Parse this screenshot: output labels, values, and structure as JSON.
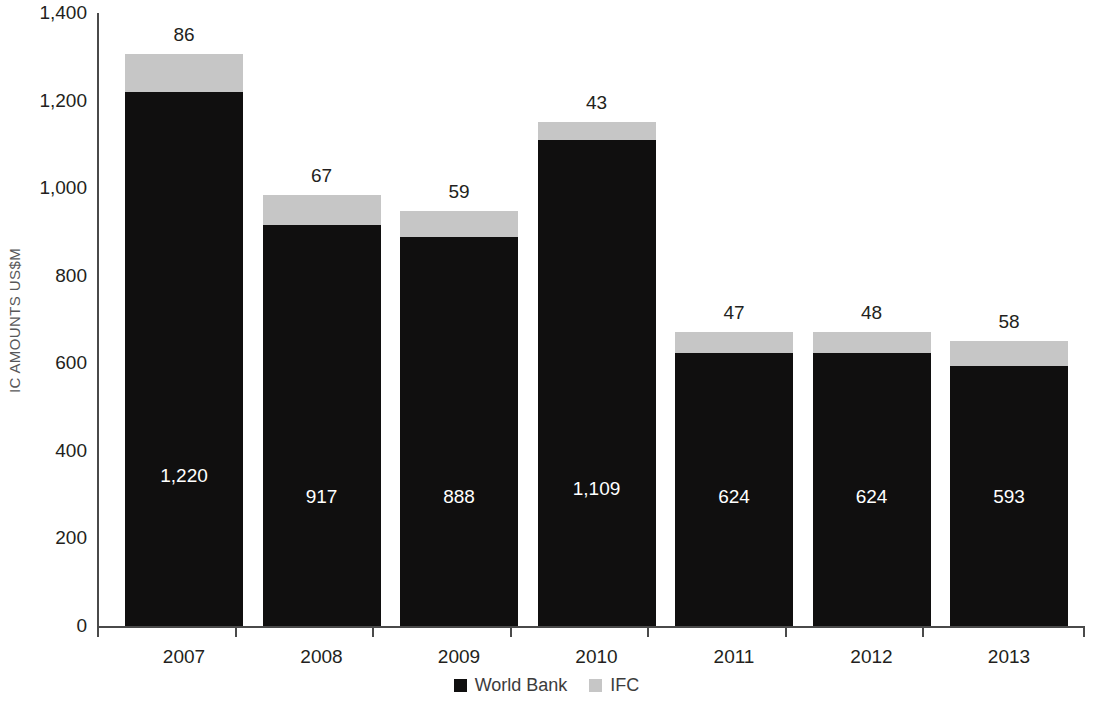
{
  "chart_data": {
    "type": "bar",
    "subtype": "stacked-vertical",
    "title": "",
    "subtitle": "",
    "xlabel": "",
    "ylabel": "IC AMOUNTS US$M",
    "categories": [
      "2007",
      "2008",
      "2009",
      "2010",
      "2011",
      "2012",
      "2013"
    ],
    "series": [
      {
        "name": "World Bank",
        "color": "#100f0f",
        "values": [
          1220,
          917,
          888,
          1109,
          624,
          624,
          593
        ],
        "value_labels": [
          "1,220",
          "917",
          "888",
          "1,109",
          "624",
          "624",
          "593"
        ],
        "label_color": "#ffffff"
      },
      {
        "name": "IFC",
        "color": "#c6c6c6",
        "values": [
          86,
          67,
          59,
          43,
          47,
          48,
          58
        ],
        "value_labels": [
          "86",
          "67",
          "59",
          "43",
          "47",
          "48",
          "58"
        ],
        "label_color": "#231f20"
      }
    ],
    "totals": [
      1306,
      984,
      947,
      1152,
      671,
      672,
      651
    ],
    "ylim": [
      0,
      1400
    ],
    "ytick_values": [
      0,
      200,
      400,
      600,
      800,
      1000,
      1200,
      1400
    ],
    "ytick_labels": [
      "0",
      "200",
      "400",
      "600",
      "800",
      "1,000",
      "1,200",
      "1,400"
    ],
    "grid": false,
    "legend_position": "bottom-center",
    "legend": [
      {
        "label": "World Bank",
        "color": "#100f0f"
      },
      {
        "label": "IFC",
        "color": "#c6c6c6"
      }
    ]
  },
  "colors": {
    "world_bank": "#100f0f",
    "ifc": "#c6c6c6",
    "axis": "#4a4a4a",
    "text": "#231f20",
    "axis_title": "#58585a",
    "background": "#ffffff"
  }
}
